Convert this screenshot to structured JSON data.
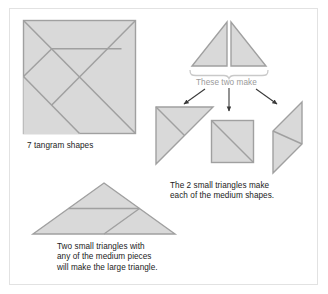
{
  "figure": {
    "type": "diagram",
    "subject": "tangram",
    "border_color": "#e2e2e2",
    "background": "#ffffff",
    "shape_fill": "#d8d8d8",
    "shape_stroke": "#9d9d9d",
    "arrow_color": "#3a3a3a",
    "brace_color": "#c9c9c9",
    "text_color": "#1b1b1b",
    "muted_text_color": "#9a9a9a"
  },
  "captions": {
    "tangram_square": "7 tangram shapes",
    "these_two_make": "These two make",
    "medium_shapes": "The 2 small triangles make\neach of the medium shapes.",
    "large_triangle": "Two small triangles with\nany of the medium pieces\nwill make the large triangle."
  },
  "shapes": {
    "tangram_square": {
      "name": "7 tangram shapes",
      "piece_count": 7,
      "pieces": [
        "large triangle",
        "large triangle",
        "medium triangle",
        "small triangle",
        "small triangle",
        "square",
        "parallelogram"
      ]
    },
    "small_triangles": {
      "count": 2,
      "labels": [
        "small triangle left",
        "small triangle right"
      ]
    },
    "medium_shapes": [
      {
        "name": "medium triangle",
        "divisions": 2
      },
      {
        "name": "square",
        "divisions": 2
      },
      {
        "name": "parallelogram",
        "divisions": 2
      }
    ],
    "large_triangle": {
      "name": "large triangle",
      "divisions": 3
    }
  },
  "arrows": {
    "count": 3,
    "targets": [
      "medium triangle",
      "square",
      "parallelogram"
    ]
  }
}
